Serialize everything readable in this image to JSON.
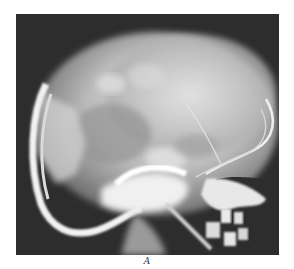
{
  "figure": {
    "caption": "A",
    "colors": {
      "background": "#2e2e2e",
      "bone_bright": "#f2f2f2",
      "cranium": "#c8c8c8",
      "soft_gray": "#8a8a8a",
      "page": "#ffffff"
    }
  }
}
